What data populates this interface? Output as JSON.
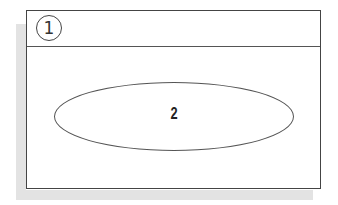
{
  "diagram": {
    "header": {
      "callout_label": "1"
    },
    "content": {
      "region_label": "2"
    },
    "colors": {
      "border": "#444444",
      "shadow": "#e3e3e3",
      "background": "#ffffff"
    }
  }
}
